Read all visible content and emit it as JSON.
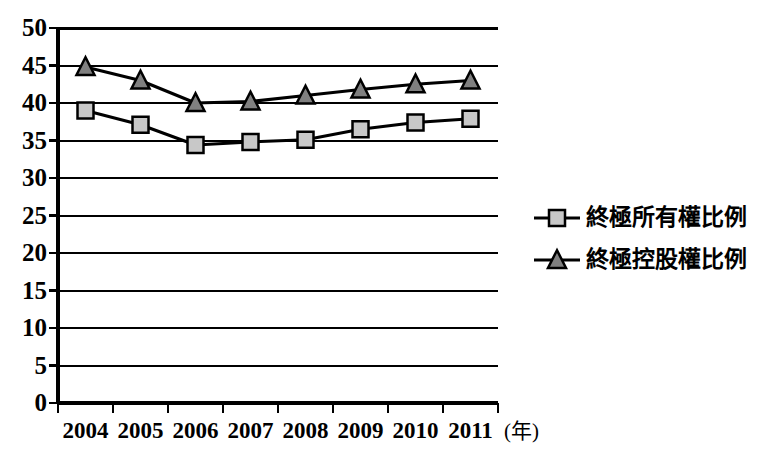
{
  "chart_data": {
    "type": "line",
    "title": "",
    "subtitle": "",
    "xlabel": "(年)",
    "ylabel": "",
    "categories": [
      "2004",
      "2005",
      "2006",
      "2007",
      "2008",
      "2009",
      "2010",
      "2011"
    ],
    "ylim": [
      0,
      50
    ],
    "ytick_step": 5,
    "yticks": [
      "50",
      "45",
      "40",
      "35",
      "30",
      "25",
      "20",
      "15",
      "10",
      "5",
      "0"
    ],
    "grid": "horizontal",
    "legend_position": "right",
    "series": [
      {
        "name": "終極所有權比例",
        "marker": "square",
        "marker_fill": "#c8c8c8",
        "marker_stroke": "#000000",
        "line_color": "#000000",
        "values": [
          39.0,
          37.1,
          34.4,
          34.8,
          35.1,
          36.5,
          37.4,
          37.9
        ]
      },
      {
        "name": "終極控股權比例",
        "marker": "triangle",
        "marker_fill": "#808080",
        "marker_stroke": "#000000",
        "line_color": "#000000",
        "values": [
          44.8,
          43.0,
          40.0,
          40.2,
          41.0,
          41.8,
          42.5,
          43.0
        ]
      }
    ]
  },
  "colors": {
    "background": "#ffffff",
    "axis": "#000000",
    "grid": "#000000",
    "text": "#000000"
  }
}
